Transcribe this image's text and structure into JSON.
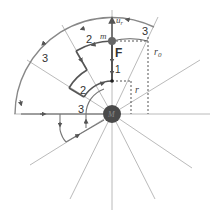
{
  "labels": {
    "mass_m": "m",
    "mass_M": "M",
    "force": "F",
    "unit_vector": "u",
    "unit_vector_sub": "r",
    "r0": "r",
    "r0_sub": "0",
    "r": "r",
    "path1": "1",
    "path2_outer": "2",
    "path2_inner": "2",
    "path3_outer": "3",
    "path3_top": "3",
    "path3_inner": "3"
  },
  "colors": {
    "line": "#9a9a9a",
    "path": "#555555",
    "mass": "#4a4a4a"
  }
}
